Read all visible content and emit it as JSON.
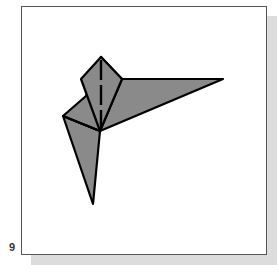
{
  "step": {
    "number": "9"
  },
  "colors": {
    "paper_fill": "#8a8a8a",
    "stroke": "#000000",
    "frame_border": "#555555",
    "frame_shadow": "#dcdcdc",
    "background": "#ffffff"
  },
  "diagram": {
    "shapes": {
      "wing": "100,131 122,79 223,79",
      "left_flap": "63,116 86,96 101,57 122,79 100,131",
      "tail": "63,116 100,131 93,204",
      "kite": "81,79 101,57 122,79 100,131"
    },
    "fold_lines": {
      "inner_left_crease": "63,116 100,131",
      "dashed_fold": {
        "x1": 101,
        "y1": 60,
        "x2": 101,
        "y2": 128
      }
    }
  }
}
